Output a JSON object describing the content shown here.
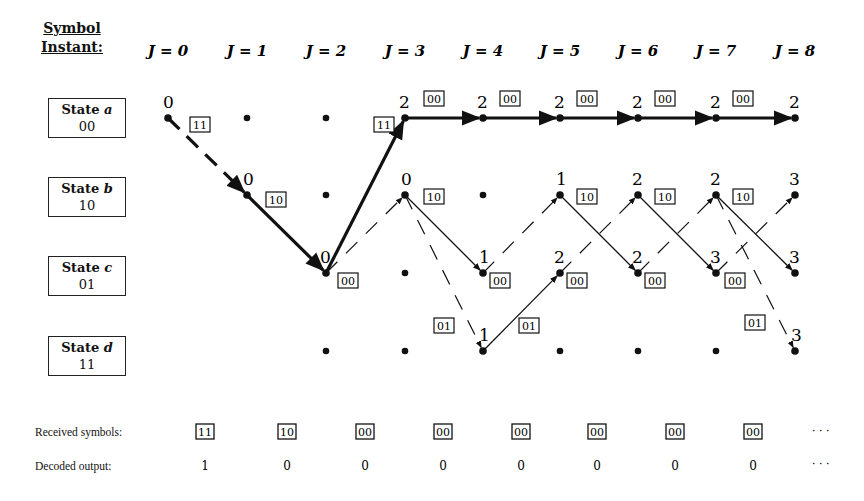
{
  "header": {
    "line1": "Symbol",
    "line2": "Instant:"
  },
  "instants": [
    "J = 0",
    "J = 1",
    "J = 2",
    "J = 3",
    "J = 4",
    "J = 5",
    "J = 6",
    "J = 7",
    "J = 8"
  ],
  "states": [
    {
      "id": "a",
      "label": "State a",
      "code": "00"
    },
    {
      "id": "b",
      "label": "State b",
      "code": "10"
    },
    {
      "id": "c",
      "label": "State c",
      "code": "01"
    },
    {
      "id": "d",
      "label": "State d",
      "code": "11"
    }
  ],
  "nodes": [
    {
      "j": 0,
      "s": 0,
      "metric": "0",
      "lx": -5,
      "ly": -10
    },
    {
      "j": 1,
      "s": 1,
      "metric": "0",
      "lx": -4,
      "ly": -10
    },
    {
      "j": 2,
      "s": 2,
      "metric": "0",
      "lx": -6,
      "ly": -10
    },
    {
      "j": 3,
      "s": 0,
      "metric": "2",
      "lx": -6,
      "ly": -10
    },
    {
      "j": 3,
      "s": 1,
      "metric": "0",
      "lx": -4,
      "ly": -10
    },
    {
      "j": 4,
      "s": 0,
      "metric": "2",
      "lx": -6,
      "ly": -10
    },
    {
      "j": 4,
      "s": 2,
      "metric": "1",
      "lx": -4,
      "ly": -10
    },
    {
      "j": 4,
      "s": 3,
      "metric": "1",
      "lx": -4,
      "ly": -10
    },
    {
      "j": 5,
      "s": 0,
      "metric": "2",
      "lx": -6,
      "ly": -10
    },
    {
      "j": 5,
      "s": 1,
      "metric": "1",
      "lx": -4,
      "ly": -10
    },
    {
      "j": 5,
      "s": 2,
      "metric": "2",
      "lx": -6,
      "ly": -10
    },
    {
      "j": 6,
      "s": 0,
      "metric": "2",
      "lx": -6,
      "ly": -10
    },
    {
      "j": 6,
      "s": 1,
      "metric": "2",
      "lx": -6,
      "ly": -10
    },
    {
      "j": 6,
      "s": 2,
      "metric": "2",
      "lx": -6,
      "ly": -10
    },
    {
      "j": 7,
      "s": 0,
      "metric": "2",
      "lx": -6,
      "ly": -10
    },
    {
      "j": 7,
      "s": 1,
      "metric": "2",
      "lx": -6,
      "ly": -10
    },
    {
      "j": 7,
      "s": 2,
      "metric": "3",
      "lx": -6,
      "ly": -10
    },
    {
      "j": 8,
      "s": 0,
      "metric": "2",
      "lx": -6,
      "ly": -10
    },
    {
      "j": 8,
      "s": 1,
      "metric": "3",
      "lx": -6,
      "ly": -10
    },
    {
      "j": 8,
      "s": 2,
      "metric": "3",
      "lx": -6,
      "ly": -10
    },
    {
      "j": 8,
      "s": 3,
      "metric": "3",
      "lx": -4,
      "ly": -10
    }
  ],
  "empty_nodes": [
    {
      "j": 1,
      "s": 0
    },
    {
      "j": 2,
      "s": 0
    },
    {
      "j": 2,
      "s": 1
    },
    {
      "j": 2,
      "s": 3
    },
    {
      "j": 3,
      "s": 2
    },
    {
      "j": 3,
      "s": 3
    },
    {
      "j": 4,
      "s": 1
    },
    {
      "j": 5,
      "s": 3
    },
    {
      "j": 6,
      "s": 3
    },
    {
      "j": 7,
      "s": 3
    }
  ],
  "branches": [
    {
      "from": [
        0,
        0
      ],
      "to": [
        1,
        1
      ],
      "style": "bold-dashed"
    },
    {
      "from": [
        1,
        1
      ],
      "to": [
        2,
        2
      ],
      "style": "bold"
    },
    {
      "from": [
        2,
        2
      ],
      "to": [
        3,
        0
      ],
      "style": "bold"
    },
    {
      "from": [
        3,
        0
      ],
      "to": [
        4,
        0
      ],
      "style": "bold"
    },
    {
      "from": [
        4,
        0
      ],
      "to": [
        5,
        0
      ],
      "style": "bold"
    },
    {
      "from": [
        5,
        0
      ],
      "to": [
        6,
        0
      ],
      "style": "bold"
    },
    {
      "from": [
        6,
        0
      ],
      "to": [
        7,
        0
      ],
      "style": "bold"
    },
    {
      "from": [
        7,
        0
      ],
      "to": [
        8,
        0
      ],
      "style": "bold"
    },
    {
      "from": [
        2,
        2
      ],
      "to": [
        3,
        1
      ],
      "style": "dashed"
    },
    {
      "from": [
        3,
        1
      ],
      "to": [
        4,
        2
      ],
      "style": "thin"
    },
    {
      "from": [
        3,
        1
      ],
      "to": [
        4,
        3
      ],
      "style": "dashed"
    },
    {
      "from": [
        4,
        2
      ],
      "to": [
        5,
        1
      ],
      "style": "dashed"
    },
    {
      "from": [
        4,
        3
      ],
      "to": [
        5,
        2
      ],
      "style": "thin"
    },
    {
      "from": [
        5,
        1
      ],
      "to": [
        6,
        2
      ],
      "style": "thin"
    },
    {
      "from": [
        5,
        2
      ],
      "to": [
        6,
        1
      ],
      "style": "dashed"
    },
    {
      "from": [
        6,
        1
      ],
      "to": [
        7,
        2
      ],
      "style": "thin"
    },
    {
      "from": [
        6,
        2
      ],
      "to": [
        7,
        1
      ],
      "style": "dashed"
    },
    {
      "from": [
        7,
        1
      ],
      "to": [
        8,
        2
      ],
      "style": "thin"
    },
    {
      "from": [
        7,
        1
      ],
      "to": [
        8,
        3
      ],
      "style": "dashed"
    },
    {
      "from": [
        7,
        2
      ],
      "to": [
        8,
        1
      ],
      "style": "dashed"
    }
  ],
  "branch_symbols": [
    {
      "text": "11",
      "x": 190,
      "y": 125
    },
    {
      "text": "10",
      "x": 266,
      "y": 200
    },
    {
      "text": "00",
      "x": 338,
      "y": 281
    },
    {
      "text": "11",
      "x": 374,
      "y": 125
    },
    {
      "text": "00",
      "x": 424,
      "y": 99
    },
    {
      "text": "10",
      "x": 424,
      "y": 197
    },
    {
      "text": "01",
      "x": 434,
      "y": 326
    },
    {
      "text": "00",
      "x": 500,
      "y": 99
    },
    {
      "text": "00",
      "x": 490,
      "y": 281
    },
    {
      "text": "01",
      "x": 519,
      "y": 326
    },
    {
      "text": "00",
      "x": 577,
      "y": 99
    },
    {
      "text": "10",
      "x": 577,
      "y": 197
    },
    {
      "text": "00",
      "x": 567,
      "y": 281
    },
    {
      "text": "00",
      "x": 655,
      "y": 99
    },
    {
      "text": "10",
      "x": 655,
      "y": 197
    },
    {
      "text": "00",
      "x": 645,
      "y": 281
    },
    {
      "text": "00",
      "x": 733,
      "y": 99
    },
    {
      "text": "10",
      "x": 733,
      "y": 197
    },
    {
      "text": "00",
      "x": 725,
      "y": 281
    },
    {
      "text": "01",
      "x": 745,
      "y": 323
    }
  ],
  "received": {
    "label": "Received symbols:",
    "symbols": [
      "11",
      "10",
      "00",
      "00",
      "00",
      "00",
      "00",
      "00"
    ],
    "ellipsis": "· · ·"
  },
  "decoded": {
    "label": "Decoded output:",
    "bits": [
      "1",
      "0",
      "0",
      "0",
      "0",
      "0",
      "0",
      "0"
    ],
    "ellipsis": "· · ·"
  }
}
